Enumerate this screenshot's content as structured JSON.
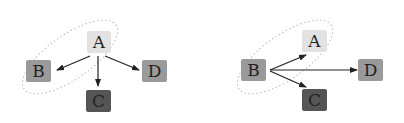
{
  "diagrams": [
    {
      "id": "left",
      "nodes": [
        {
          "label": "A",
          "x": 98,
          "y": 42,
          "fill": "#e2e2e2"
        },
        {
          "label": "B",
          "x": 38,
          "y": 72,
          "fill": "#9a9a9a"
        },
        {
          "label": "C",
          "x": 98,
          "y": 102,
          "fill": "#555555"
        },
        {
          "label": "D",
          "x": 155,
          "y": 72,
          "fill": "#9a9a9a"
        }
      ],
      "edges": [
        [
          "A",
          "B"
        ],
        [
          "A",
          "C"
        ],
        [
          "A",
          "D"
        ]
      ]
    },
    {
      "id": "right",
      "nodes": [
        {
          "label": "A",
          "x": 315,
          "y": 42,
          "fill": "#e2e2e2"
        },
        {
          "label": "B",
          "x": 254,
          "y": 72,
          "fill": "#9a9a9a"
        },
        {
          "label": "C",
          "x": 315,
          "y": 102,
          "fill": "#555555"
        },
        {
          "label": "D",
          "x": 371,
          "y": 72,
          "fill": "#9a9a9a"
        }
      ],
      "edges": [
        [
          "B",
          "A"
        ],
        [
          "B",
          "C"
        ],
        [
          "B",
          "D"
        ]
      ]
    }
  ]
}
